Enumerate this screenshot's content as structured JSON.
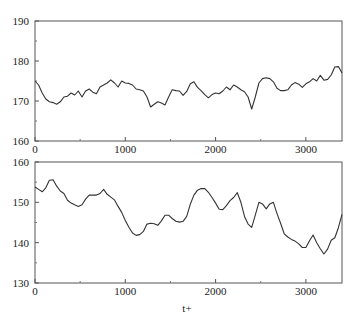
{
  "chart_data": [
    {
      "type": "line",
      "title": "",
      "xlabel": "",
      "ylabel": "",
      "xlim": [
        0,
        3400
      ],
      "ylim": [
        160,
        190
      ],
      "xticks": [
        0,
        1000,
        2000,
        3000
      ],
      "xtick_labels": [
        "0",
        "1000",
        "2000",
        "3000"
      ],
      "xminor_ticks": [
        500,
        1500,
        2500
      ],
      "yticks": [
        160,
        170,
        180,
        190
      ],
      "ytick_labels": [
        "160",
        "170",
        "180",
        "190"
      ],
      "yminor_ticks": [
        165,
        175,
        185
      ],
      "grid": false,
      "legend": null,
      "series": [
        {
          "name": "top-series",
          "x": [
            0,
            40,
            80,
            120,
            160,
            200,
            240,
            280,
            320,
            360,
            400,
            440,
            480,
            520,
            560,
            600,
            640,
            680,
            720,
            760,
            800,
            840,
            880,
            920,
            960,
            1000,
            1040,
            1080,
            1120,
            1160,
            1200,
            1240,
            1280,
            1320,
            1360,
            1400,
            1440,
            1480,
            1520,
            1560,
            1600,
            1640,
            1680,
            1720,
            1760,
            1800,
            1840,
            1880,
            1920,
            1960,
            2000,
            2040,
            2080,
            2120,
            2160,
            2200,
            2240,
            2280,
            2320,
            2360,
            2400,
            2440,
            2480,
            2520,
            2560,
            2600,
            2640,
            2680,
            2720,
            2760,
            2800,
            2840,
            2880,
            2920,
            2960,
            3000,
            3040,
            3080,
            3120,
            3160,
            3200,
            3240,
            3280,
            3320,
            3360,
            3400
          ],
          "y": [
            175,
            174,
            172,
            170.5,
            169.8,
            169.6,
            169.2,
            169.8,
            171,
            171.2,
            172,
            171.5,
            172.5,
            171,
            172.5,
            173,
            172.2,
            171.8,
            173.5,
            174,
            174.5,
            175.3,
            174.5,
            173.5,
            175,
            174.5,
            174.4,
            174,
            173,
            172.8,
            172.5,
            171,
            168.5,
            169.2,
            169.8,
            169.5,
            169,
            171,
            172.8,
            172.6,
            172.5,
            171.4,
            172.4,
            174.3,
            174.8,
            173.4,
            172.6,
            171.6,
            170.8,
            171.6,
            172,
            171.8,
            172.5,
            173.5,
            172.8,
            174,
            173.5,
            172.8,
            172.3,
            171,
            168,
            171,
            174.5,
            175.6,
            175.8,
            175.6,
            174.8,
            173.2,
            172.6,
            172.6,
            172.8,
            174,
            174.6,
            174.2,
            173.4,
            174.3,
            174.8,
            175.6,
            175,
            176.4,
            175.2,
            175.4,
            176.5,
            178.5,
            178.6,
            177,
            175.3,
            173,
            172.6,
            171.8,
            172.5,
            171.8,
            171.6
          ],
          "color": "#333333"
        }
      ]
    },
    {
      "type": "line",
      "title": "",
      "xlabel": "t+",
      "ylabel": "",
      "xlim": [
        0,
        3400
      ],
      "ylim": [
        130,
        160
      ],
      "xticks": [
        0,
        1000,
        2000,
        3000
      ],
      "xtick_labels": [
        "0",
        "1000",
        "2000",
        "3000"
      ],
      "xminor_ticks": [
        500,
        1500,
        2500
      ],
      "yticks": [
        130,
        140,
        150,
        160
      ],
      "ytick_labels": [
        "130",
        "140",
        "150",
        "160"
      ],
      "yminor_ticks": [
        135,
        145,
        155
      ],
      "grid": false,
      "legend": null,
      "series": [
        {
          "name": "bottom-series",
          "x": [
            0,
            40,
            80,
            120,
            160,
            200,
            240,
            280,
            320,
            360,
            400,
            440,
            480,
            520,
            560,
            600,
            640,
            680,
            720,
            760,
            800,
            840,
            880,
            920,
            960,
            1000,
            1040,
            1080,
            1120,
            1160,
            1200,
            1240,
            1280,
            1320,
            1360,
            1400,
            1440,
            1480,
            1520,
            1560,
            1600,
            1640,
            1680,
            1720,
            1760,
            1800,
            1840,
            1880,
            1920,
            1960,
            2000,
            2040,
            2080,
            2120,
            2160,
            2200,
            2240,
            2280,
            2320,
            2360,
            2400,
            2440,
            2480,
            2520,
            2560,
            2600,
            2640,
            2680,
            2720,
            2760,
            2800,
            2840,
            2880,
            2920,
            2960,
            3000,
            3040,
            3080,
            3120,
            3160,
            3200,
            3240,
            3280,
            3320,
            3360,
            3400
          ],
          "y": [
            153.8,
            153.2,
            152.6,
            153.6,
            155.5,
            155.6,
            154,
            152.8,
            152.2,
            150.5,
            149.8,
            149.4,
            149,
            149.4,
            150.8,
            151.8,
            151.8,
            151.8,
            152.2,
            153.2,
            152,
            151.3,
            150.6,
            149,
            147.5,
            145.5,
            143.8,
            142.4,
            141.8,
            142,
            142.8,
            144.6,
            144.8,
            144.7,
            144.3,
            145.4,
            146.8,
            146.8,
            146,
            145.3,
            145.1,
            145.3,
            146.5,
            149.5,
            151.8,
            153,
            153.4,
            153.4,
            152.5,
            151.2,
            149.8,
            148.3,
            148.2,
            149.2,
            150.4,
            151.2,
            152.4,
            150,
            146.5,
            144.6,
            143.8,
            146.8,
            150,
            149.6,
            148.4,
            149.6,
            150,
            147.2,
            144.8,
            142.2,
            141.4,
            140.8,
            140.4,
            139.7,
            138.8,
            138.8,
            140.5,
            141.9,
            140,
            138.5,
            137.2,
            138.4,
            140.6,
            141.2,
            143.7,
            147
          ],
          "color": "#333333"
        }
      ]
    }
  ],
  "panels": {
    "top": {
      "y_tick_labels": [
        "190",
        "180",
        "170",
        "160"
      ],
      "x_tick_labels": [
        "0",
        "1000",
        "2000",
        "3000"
      ]
    },
    "bottom": {
      "y_tick_labels": [
        "160",
        "150",
        "140",
        "130"
      ],
      "x_tick_labels": [
        "0",
        "1000",
        "2000",
        "3000"
      ],
      "x_axis_label": "t+"
    }
  }
}
